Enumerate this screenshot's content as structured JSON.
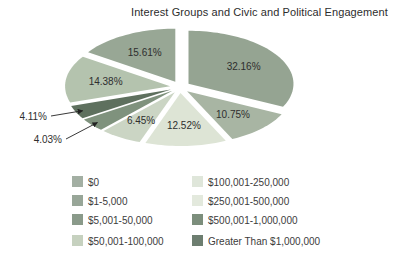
{
  "title": "Interest Groups and Civic and Political Engagement",
  "chart_data": {
    "type": "pie",
    "title": "Interest Groups and Civic and Political Engagement",
    "categories": [
      "$0",
      "$1-5,000",
      "$5,001-50,000",
      "$50,001-100,000",
      "$100,001-250,000",
      "$250,001-500,000",
      "$500,001-1,000,000",
      "Greater Than $1,000,000"
    ],
    "values": [
      32.16,
      10.75,
      12.52,
      6.45,
      4.03,
      4.11,
      14.38,
      15.61
    ],
    "slice_labels": [
      "32.16%",
      "10.75%",
      "12.52%",
      "6.45%",
      "4.03%",
      "4.11%",
      "14.38%",
      "15.61%"
    ],
    "slice_colors": [
      "#95a492",
      "#a8b5a3",
      "#dde4d5",
      "#cbd5c4",
      "#7f927d",
      "#5e705e",
      "#b4c3ae",
      "#98a795"
    ],
    "legend": {
      "position": "bottom",
      "columns": 2,
      "items": [
        {
          "label": "$0",
          "color": "#a3afa3"
        },
        {
          "label": "$1-5,000",
          "color": "#98a698"
        },
        {
          "label": "$5,001-50,000",
          "color": "#8a9a8a"
        },
        {
          "label": "$50,001-100,000",
          "color": "#c6d1bf"
        },
        {
          "label": "$100,001-250,000",
          "color": "#dfe6da"
        },
        {
          "label": "$250,001-500,000",
          "color": "#e3e9dd"
        },
        {
          "label": "$500,001-1,000,000",
          "color": "#7c8e7c"
        },
        {
          "label": "Greater Than $1,000,000",
          "color": "#6d7e70"
        }
      ]
    },
    "layout": {
      "cx": 180,
      "cy": 87,
      "rx": 105,
      "ry": 53,
      "explode_x": 10,
      "explode_y": 6,
      "start_angle_deg": 0,
      "direction": "clockwise",
      "label_radius": 0.62,
      "callouts": [
        {
          "index": 4,
          "text_x": 62,
          "text_y": 143
        },
        {
          "index": 5,
          "text_x": 47,
          "text_y": 120
        }
      ]
    }
  }
}
